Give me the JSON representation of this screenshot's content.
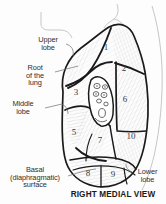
{
  "figure": {
    "title": "RIGHT MEDIAL VIEW",
    "style": "black and white anatomical line drawing, hatched shading"
  },
  "labels": [
    {
      "id": "upper-lobe",
      "text": "Upper\nlobe",
      "side": "left"
    },
    {
      "id": "root",
      "text": "Root\nof the\nlung",
      "side": "left"
    },
    {
      "id": "middle-lobe",
      "text": "Middle\nlobe",
      "side": "left"
    },
    {
      "id": "basal",
      "text": "Basal\n(diaphragmatic)\nsurface",
      "side": "left"
    },
    {
      "id": "lower-lobe",
      "text": "Lower\nlobe",
      "side": "right"
    }
  ],
  "segments": [
    {
      "number": "1",
      "x": 106,
      "y": 50
    },
    {
      "number": "2",
      "x": 124,
      "y": 71
    },
    {
      "number": "3",
      "x": 76,
      "y": 95
    },
    {
      "number": "5",
      "x": 74,
      "y": 135
    },
    {
      "number": "6",
      "x": 125,
      "y": 102
    },
    {
      "number": "7",
      "x": 100,
      "y": 143
    },
    {
      "number": "8",
      "x": 88,
      "y": 176
    },
    {
      "number": "9",
      "x": 113,
      "y": 177
    },
    {
      "number": "10",
      "x": 131,
      "y": 139
    }
  ],
  "colors": {
    "ink": "#2b2b2b",
    "outline": "#1a1a1a",
    "hatch": "#8d8d8d",
    "thin_contour": "#b9b9b9",
    "background": "#ffffff"
  }
}
